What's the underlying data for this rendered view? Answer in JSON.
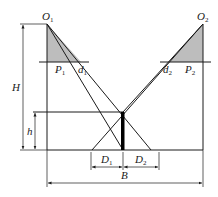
{
  "diagram": {
    "colors": {
      "line": "#1a1a1a",
      "shade": "#bdbdbd",
      "background": "#ffffff"
    },
    "labels": {
      "O1": {
        "main": "O",
        "sub": "1"
      },
      "O2": {
        "main": "O",
        "sub": "2"
      },
      "P1": {
        "main": "P",
        "sub": "1"
      },
      "P2": {
        "main": "P",
        "sub": "2"
      },
      "d1": {
        "main": "d",
        "sub": "1"
      },
      "d2": {
        "main": "d",
        "sub": "2"
      },
      "D1": {
        "main": "D",
        "sub": "1"
      },
      "D2": {
        "main": "D",
        "sub": "2"
      },
      "H": "H",
      "h": "h",
      "B": "B"
    }
  }
}
